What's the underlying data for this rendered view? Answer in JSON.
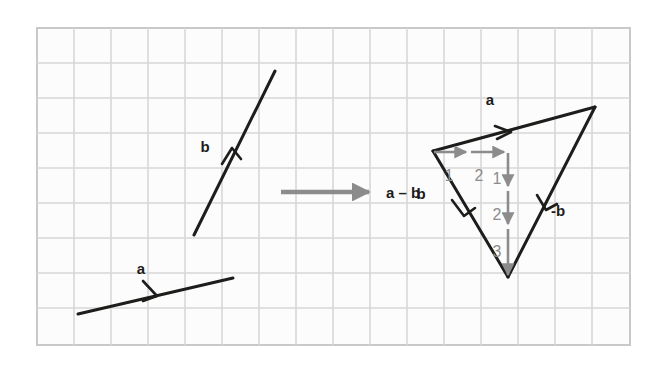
{
  "figure": {
    "background_color": "#ffffff",
    "grid": {
      "border_color": "#c9c9c9",
      "line_color": "#d5d5d5",
      "fill_color": "#fcfcfc",
      "x": 37,
      "y": 28,
      "width": 593,
      "height": 317,
      "cell_size": 37,
      "columns": 16,
      "rows": 9
    },
    "vector_color": "#1d1d1b",
    "helper_color": "#8c8c8c",
    "labels": {
      "a_left": "a",
      "b_left": "b",
      "operation": "a – b",
      "a_triangle": "a",
      "b_triangle": "b",
      "neg_b_triangle": "-b",
      "count_h1": "1",
      "count_h2": "2",
      "count_v1": "1",
      "count_v2": "2",
      "count_v3": "3"
    },
    "left_panel": {
      "vector_a": {
        "x1": 78,
        "y1": 314,
        "x2": 233,
        "y2": 278,
        "label": "a",
        "label_x": 141,
        "label_y": 270
      },
      "vector_b": {
        "x1": 194,
        "y1": 235,
        "x2": 275,
        "y2": 71,
        "label": "b",
        "label_x": 205,
        "label_y": 146
      }
    },
    "transition_arrow": {
      "x1": 281,
      "y1": 192,
      "x2": 375,
      "y2": 192,
      "color": "#8c8c8c",
      "label": "a – b",
      "label_x": 386,
      "label_y": 198
    },
    "right_panel": {
      "triangle": {
        "left_vertex": {
          "x": 433,
          "y": 151
        },
        "top_right_vertex": {
          "x": 595,
          "y": 107
        },
        "bottom_vertex": {
          "x": 508,
          "y": 277
        }
      },
      "edges": [
        {
          "name": "a",
          "from": "left_vertex",
          "to": "top_right_vertex",
          "label": "a",
          "label_x": 490,
          "label_y": 104
        },
        {
          "name": "-b",
          "from": "top_right_vertex",
          "to": "bottom_vertex",
          "label": "-b",
          "label_x": 551,
          "label_y": 215
        },
        {
          "name": "a-b",
          "from": "left_vertex",
          "to": "bottom_vertex",
          "label": "b",
          "label_x": 417,
          "label_y": 198
        }
      ],
      "component_arrows": {
        "horizontal": {
          "x1": 434,
          "y1": 152,
          "x2": 508,
          "y2": 152,
          "cells": 2
        },
        "vertical": {
          "x1": 508,
          "y1": 152,
          "x2": 508,
          "y2": 277,
          "cells": 3
        }
      },
      "count_markers": [
        {
          "label": "1",
          "x": 449,
          "y": 177,
          "axis": "horizontal"
        },
        {
          "label": "2",
          "x": 478,
          "y": 177,
          "axis": "horizontal"
        },
        {
          "label": "1",
          "x": 496,
          "y": 180,
          "axis": "vertical"
        },
        {
          "label": "2",
          "x": 496,
          "y": 216,
          "axis": "vertical"
        },
        {
          "label": "3",
          "x": 496,
          "y": 253,
          "axis": "vertical"
        }
      ]
    }
  }
}
